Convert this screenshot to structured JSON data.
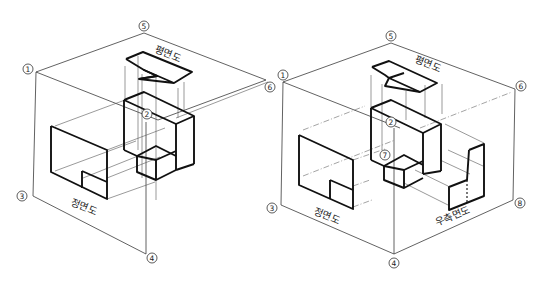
{
  "diagram": {
    "left_figure": {
      "markers": [
        {
          "id": "1",
          "symbol": "①",
          "x": 28,
          "y": 69
        },
        {
          "id": "5",
          "symbol": "⑤",
          "x": 144,
          "y": 26
        },
        {
          "id": "6",
          "symbol": "⑥",
          "x": 270,
          "y": 87
        },
        {
          "id": "2",
          "symbol": "②",
          "x": 147,
          "y": 114
        },
        {
          "id": "3",
          "symbol": "③",
          "x": 22,
          "y": 196
        },
        {
          "id": "4",
          "symbol": "④",
          "x": 152,
          "y": 258
        }
      ],
      "labels": {
        "plan_view": "평면도",
        "front_view": "정면도"
      }
    },
    "right_figure": {
      "markers": [
        {
          "id": "1",
          "symbol": "①",
          "x": 283,
          "y": 75
        },
        {
          "id": "5",
          "symbol": "⑤",
          "x": 391,
          "y": 36
        },
        {
          "id": "6",
          "symbol": "⑥",
          "x": 518,
          "y": 88
        },
        {
          "id": "2",
          "symbol": "②",
          "x": 391,
          "y": 122
        },
        {
          "id": "7",
          "symbol": "⑦",
          "x": 385,
          "y": 156
        },
        {
          "id": "3",
          "symbol": "③",
          "x": 272,
          "y": 207
        },
        {
          "id": "8",
          "symbol": "⑧",
          "x": 520,
          "y": 203
        },
        {
          "id": "4",
          "symbol": "④",
          "x": 394,
          "y": 262
        }
      ],
      "labels": {
        "plan_view": "평면도",
        "front_view": "정면도",
        "right_side_view": "우측면도"
      }
    }
  }
}
